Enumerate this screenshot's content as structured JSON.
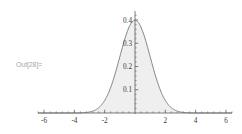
{
  "cell": {
    "out_label": "Out[28]="
  },
  "chart_data": {
    "type": "area",
    "title": "",
    "subtitle": "",
    "xlabel": "",
    "ylabel": "",
    "function": "PDF[NormalDistribution[0,1], x]",
    "xlim": [
      -6.4,
      6.4
    ],
    "ylim": [
      0,
      0.43
    ],
    "grid": false,
    "legend": false,
    "legend_position": "none",
    "axis_origin": [
      0,
      0
    ],
    "x_major_ticks": [
      -6,
      -4,
      -2,
      2,
      4,
      6
    ],
    "x_major_tick_labels": [
      "-6",
      "-4",
      "-2",
      "2",
      "4",
      "6"
    ],
    "x_minor_tick_step": 0.4,
    "y_major_ticks": [
      0.1,
      0.2,
      0.3,
      0.4
    ],
    "y_major_tick_labels": [
      "0.1",
      "0.2",
      "0.3",
      "0.4"
    ],
    "y_minor_tick_step": 0.02,
    "peak_value": 0.3989,
    "peak_x": 0,
    "stroke_color": "#6e6e6e",
    "fill_color": "#efefef",
    "axis_color": "#5a5a5a",
    "background_color": "#ffffff",
    "x": [
      -6.4,
      -6.0,
      -5.6,
      -5.2,
      -4.8,
      -4.4,
      -4.0,
      -3.6,
      -3.2,
      -2.8,
      -2.4,
      -2.0,
      -1.6,
      -1.2,
      -0.8,
      -0.4,
      0.0,
      0.4,
      0.8,
      1.2,
      1.6,
      2.0,
      2.4,
      2.8,
      3.2,
      3.6,
      4.0,
      4.4,
      4.8,
      5.2,
      5.6,
      6.0,
      6.4
    ],
    "values": [
      0.0,
      0.0,
      0.0,
      0.0,
      0.0,
      0.0,
      0.0001,
      0.0006,
      0.0024,
      0.0079,
      0.0224,
      0.054,
      0.1109,
      0.1942,
      0.2897,
      0.3683,
      0.3989,
      0.3683,
      0.2897,
      0.1942,
      0.1109,
      0.054,
      0.0224,
      0.0079,
      0.0024,
      0.0006,
      0.0001,
      0.0,
      0.0,
      0.0,
      0.0,
      0.0,
      0.0
    ]
  }
}
